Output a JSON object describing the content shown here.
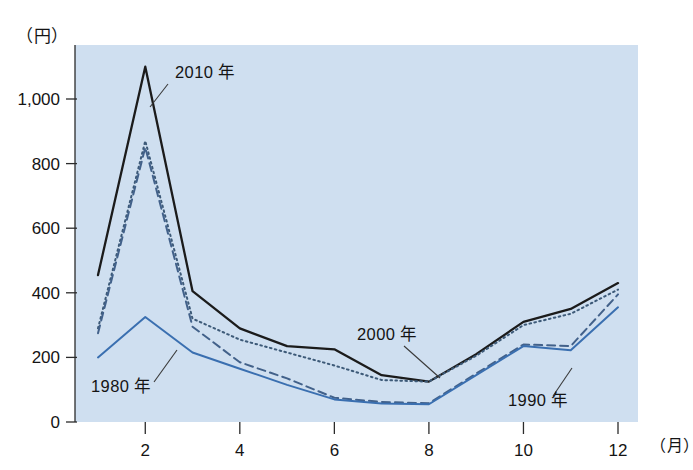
{
  "figure": {
    "y_unit_label": "（円）",
    "x_unit_label": "（月）",
    "plot_background": "#cfdff0",
    "page_background": "#ffffff"
  },
  "chart_data": {
    "type": "line",
    "title": "",
    "xlabel": "（月）",
    "ylabel": "（円）",
    "x": [
      1,
      2,
      3,
      4,
      5,
      6,
      7,
      8,
      9,
      10,
      11,
      12
    ],
    "categories": [
      "1",
      "2",
      "3",
      "4",
      "5",
      "6",
      "7",
      "8",
      "9",
      "10",
      "11",
      "12"
    ],
    "xtick_labels": [
      "2",
      "4",
      "6",
      "8",
      "10",
      "12"
    ],
    "xtick_values": [
      2,
      4,
      6,
      8,
      10,
      12
    ],
    "ytick_labels": [
      "0",
      "200",
      "400",
      "600",
      "800",
      "1,000"
    ],
    "ytick_values": [
      0,
      200,
      400,
      600,
      800,
      1000
    ],
    "xlim": [
      1,
      12
    ],
    "ylim": [
      0,
      1140
    ],
    "grid": false,
    "legend": "inline-annotations",
    "series": [
      {
        "name": "2010 年",
        "style": "solid",
        "color": "#1b1b1b",
        "width": 2.3,
        "values": [
          455,
          1100,
          405,
          290,
          235,
          225,
          145,
          125,
          210,
          310,
          350,
          430
        ]
      },
      {
        "name": "2000 年",
        "style": "dotted",
        "color": "#3d5a78",
        "width": 2.0,
        "values": [
          290,
          870,
          320,
          255,
          215,
          175,
          130,
          125,
          205,
          300,
          335,
          410
        ]
      },
      {
        "name": "1990 年",
        "style": "dashed",
        "color": "#42618a",
        "width": 2.0,
        "values": [
          275,
          850,
          295,
          185,
          135,
          75,
          62,
          58,
          150,
          240,
          235,
          395
        ]
      },
      {
        "name": "1980 年",
        "style": "solid",
        "color": "#3a6fb0",
        "width": 2.0,
        "values": [
          200,
          325,
          215,
          165,
          115,
          70,
          57,
          55,
          145,
          235,
          222,
          355
        ]
      }
    ],
    "annotations": [
      {
        "label": "2010 年",
        "text_x": 175,
        "text_y": 78,
        "leader": [
          [
            168,
            84
          ],
          [
            150,
            107
          ]
        ]
      },
      {
        "label": "2000 年",
        "text_x": 357,
        "text_y": 340,
        "leader": [
          [
            404,
            346
          ],
          [
            440,
            378
          ]
        ]
      },
      {
        "label": "1990 年",
        "text_x": 508,
        "text_y": 406,
        "leader": [
          [
            553,
            396
          ],
          [
            572,
            368
          ]
        ]
      },
      {
        "label": "1980 年",
        "text_x": 91,
        "text_y": 392,
        "leader": [
          [
            154,
            382
          ],
          [
            177,
            350
          ]
        ]
      }
    ]
  }
}
